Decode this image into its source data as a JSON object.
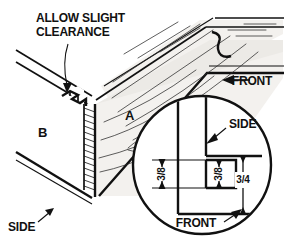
{
  "figure": {
    "kind": "technical-line-drawing",
    "background_color": "#ffffff",
    "ink_color": "#111111",
    "wood_face_color": "#f3f1ee"
  },
  "callouts": {
    "clearance_line1": "ALLOW SLIGHT",
    "clearance_line2": "CLEARANCE",
    "part_a": "A",
    "part_b": "B",
    "side_left": "SIDE",
    "front_top": "FRONT"
  },
  "detail_circle": {
    "label_side": "SIDE",
    "label_front": "FRONT",
    "dim_left": "3/8",
    "dim_middle": "3/8",
    "dim_right": "3/4",
    "center_x": 202,
    "center_y": 165,
    "radius": 69
  },
  "icons": {
    "leader_arrow": "arrow-icon",
    "break_symbol": "break-symbol-icon"
  }
}
